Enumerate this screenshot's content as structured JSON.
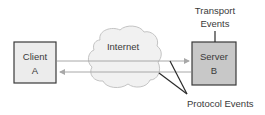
{
  "diagram": {
    "client": {
      "line1": "Client",
      "line2": "A",
      "fill": "#ececec"
    },
    "server": {
      "line1": "Server",
      "line2": "B",
      "fill": "#c8c8c8"
    },
    "cloud": {
      "label": "Internet",
      "fill": "#f1f1f1"
    },
    "transport_events": {
      "line1": "Transport",
      "line2": "Events"
    },
    "protocol_events": {
      "label": "Protocol Events"
    },
    "arrows": [
      {
        "from": "Client A",
        "to": "Server B",
        "direction": "right"
      },
      {
        "from": "Server B",
        "to": "Client A",
        "direction": "left"
      }
    ],
    "colors": {
      "box_border": "#3a3a3a",
      "arrow": "#a8a8a8",
      "callout_line": "#2a2a2a"
    }
  }
}
